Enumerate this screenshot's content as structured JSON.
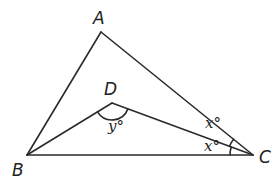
{
  "diagram": {
    "type": "triangle-angle-bisector",
    "stroke_color": "#2a2a2a",
    "background": "#ffffff",
    "vertices": {
      "A": {
        "label": "A",
        "x": 101,
        "y": 32
      },
      "B": {
        "label": "B",
        "x": 27,
        "y": 155
      },
      "C": {
        "label": "C",
        "x": 253,
        "y": 155
      },
      "D": {
        "label": "D",
        "x": 112,
        "y": 103
      }
    },
    "segments": [
      "AB",
      "AC",
      "BC",
      "BD",
      "DC"
    ],
    "angle_marks": [
      {
        "vertex": "C",
        "between": [
          "CA",
          "CD"
        ],
        "label": "x°"
      },
      {
        "vertex": "C",
        "between": [
          "CD",
          "CB"
        ],
        "label": "x°"
      },
      {
        "vertex": "D",
        "between": [
          "DB",
          "DC"
        ],
        "label": "y°"
      }
    ],
    "labels": {
      "A": "A",
      "B": "B",
      "C": "C",
      "D": "D",
      "angle_x_top": "x°",
      "angle_x_bottom": "x°",
      "angle_y": "y°"
    }
  }
}
